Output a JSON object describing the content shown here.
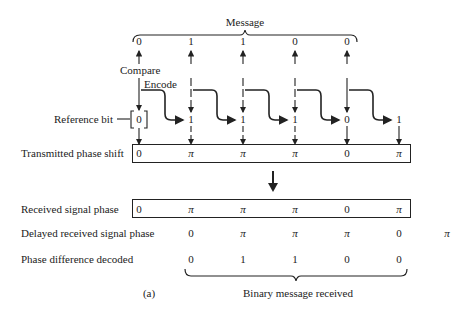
{
  "message": {
    "title": "Message",
    "bits": [
      "0",
      "1",
      "1",
      "0",
      "0"
    ]
  },
  "labels": {
    "compare": "Compare",
    "encode": "Encode",
    "reference_bit": "Reference bit",
    "reference_value": "0",
    "transmitted_phase_shift": "Transmitted phase shift",
    "received_signal_phase": "Received signal phase",
    "delayed_received_signal_phase": "Delayed received signal phase",
    "phase_difference_decoded": "Phase difference decoded",
    "figure_tag": "(a)",
    "binary_message_received": "Binary message received"
  },
  "encoded_bits": [
    "1",
    "1",
    "1",
    "0",
    "1"
  ],
  "transmitted_phase": [
    "0",
    "π",
    "π",
    "π",
    "0",
    "π"
  ],
  "received_phase": [
    "0",
    "π",
    "π",
    "π",
    "0",
    "π"
  ],
  "delayed_phase": [
    "0",
    "π",
    "π",
    "π",
    "0",
    "π"
  ],
  "decoded_bits": [
    "0",
    "1",
    "1",
    "0",
    "0"
  ]
}
